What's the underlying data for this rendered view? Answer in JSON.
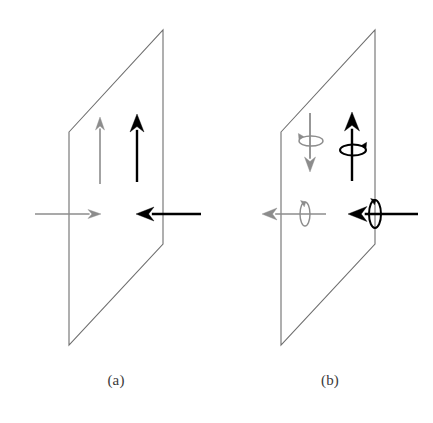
{
  "figure": {
    "width": 433,
    "height": 423,
    "background": "#ffffff"
  },
  "colors": {
    "black_vector": "#000000",
    "gray_vector": "#8c8c8c",
    "plane_outline": "#6e6e6e"
  },
  "panels": [
    {
      "id": "a",
      "caption": "(a)",
      "caption_x": 116,
      "caption_y": 382,
      "plane": {
        "name": "tilted-plane",
        "points": "69,132 163,30 163,244 69,345",
        "stroke": "#6e6e6e",
        "stroke_width": 1.1,
        "fill": "none"
      },
      "vectors": [
        {
          "name": "gray-up-arrow",
          "direction": "up",
          "color": "#8c8c8c",
          "x1": 100,
          "y1": 184,
          "x2": 100,
          "y2": 117,
          "stroke_width": 1.6,
          "head_length": 13,
          "head_half_width": 4.5,
          "spin": null
        },
        {
          "name": "black-up-arrow",
          "direction": "up",
          "color": "#000000",
          "x1": 137,
          "y1": 182,
          "x2": 137,
          "y2": 114,
          "stroke_width": 2.4,
          "head_length": 18,
          "head_half_width": 7,
          "spin": null
        },
        {
          "name": "gray-right-arrow",
          "direction": "right",
          "color": "#8c8c8c",
          "x1": 35,
          "y1": 214,
          "x2": 101,
          "y2": 214,
          "stroke_width": 1.6,
          "head_length": 13,
          "head_half_width": 4.5,
          "spin": null
        },
        {
          "name": "black-left-arrow",
          "direction": "left",
          "color": "#000000",
          "x1": 201,
          "y1": 214,
          "x2": 136,
          "y2": 214,
          "stroke_width": 2.4,
          "head_length": 18,
          "head_half_width": 7,
          "spin": null
        }
      ]
    },
    {
      "id": "b",
      "caption": "(b)",
      "caption_x": 330,
      "caption_y": 382,
      "plane": {
        "name": "tilted-plane",
        "points": "281,132 375,30 375,244 281,345",
        "stroke": "#6e6e6e",
        "stroke_width": 1.1,
        "fill": "none"
      },
      "vectors": [
        {
          "name": "gray-down-arrow",
          "direction": "down",
          "color": "#8c8c8c",
          "x1": 310,
          "y1": 113,
          "x2": 310,
          "y2": 172,
          "stroke_width": 1.8,
          "head_length": 15,
          "head_half_width": 5.5,
          "spin": {
            "name": "gray-spin-loop-horizontal",
            "cx": 311,
            "cy": 141,
            "rx": 12,
            "ry": 5,
            "orientation": "horizontal",
            "arrow_side": "left",
            "color": "#8c8c8c",
            "stroke_width": 1.4
          }
        },
        {
          "name": "black-up-arrow",
          "direction": "up",
          "color": "#000000",
          "x1": 352,
          "y1": 181,
          "x2": 352,
          "y2": 112,
          "stroke_width": 2.4,
          "head_length": 19,
          "head_half_width": 7.5,
          "spin": {
            "name": "black-spin-loop-horizontal",
            "cx": 353,
            "cy": 150,
            "rx": 13,
            "ry": 5.5,
            "orientation": "horizontal",
            "arrow_side": "right",
            "color": "#000000",
            "stroke_width": 2.0
          }
        },
        {
          "name": "gray-left-arrow",
          "direction": "left",
          "color": "#8c8c8c",
          "x1": 326,
          "y1": 214,
          "x2": 262,
          "y2": 214,
          "stroke_width": 1.6,
          "head_length": 15,
          "head_half_width": 6,
          "spin": {
            "name": "gray-spin-loop-vertical",
            "cx": 305,
            "cy": 214,
            "rx": 5,
            "ry": 12,
            "orientation": "vertical",
            "arrow_side": "top",
            "color": "#8c8c8c",
            "stroke_width": 1.4
          }
        },
        {
          "name": "black-left-arrow",
          "direction": "left",
          "color": "#000000",
          "x1": 418,
          "y1": 214,
          "x2": 348,
          "y2": 214,
          "stroke_width": 2.4,
          "head_length": 19,
          "head_half_width": 7.5,
          "spin": {
            "name": "black-spin-loop-vertical",
            "cx": 375,
            "cy": 214,
            "rx": 6,
            "ry": 14,
            "orientation": "vertical",
            "arrow_side": "top",
            "color": "#000000",
            "stroke_width": 2.0
          }
        }
      ]
    }
  ]
}
